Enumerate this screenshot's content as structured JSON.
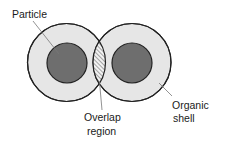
{
  "diagram": {
    "labels": {
      "particle": "Particle",
      "overlap_line1": "Overlap",
      "overlap_line2": "region",
      "shell_line1": "Organic",
      "shell_line2": "shell"
    },
    "colors": {
      "shell_fill": "#e6e6e6",
      "particle_fill": "#6e6e6e",
      "stroke": "#222222",
      "hatch": "#555555",
      "leader": "#777777"
    },
    "nodes": [
      {
        "id": "left-shell",
        "type": "organic-shell",
        "cx": 66.5,
        "cy": 62.5,
        "r": 39
      },
      {
        "id": "left-particle",
        "type": "particle",
        "cx": 67,
        "cy": 63,
        "r": 20
      },
      {
        "id": "right-shell",
        "type": "organic-shell",
        "cx": 132,
        "cy": 62.5,
        "r": 39
      },
      {
        "id": "right-particle",
        "type": "particle",
        "cx": 132,
        "cy": 63,
        "r": 20
      }
    ],
    "overlap": {
      "label": "Overlap region",
      "pattern": "hatched"
    }
  }
}
